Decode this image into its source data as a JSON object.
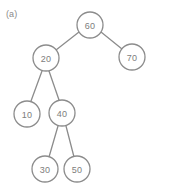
{
  "figure": {
    "label": "(a)",
    "caption_color": "#8a8a8a",
    "background_color": "#ffffff",
    "width": 171,
    "height": 189
  },
  "diagram": {
    "type": "binary-search-tree",
    "node_stroke_color": "#8c8c8c",
    "node_fill_color": "#ffffff",
    "node_text_color": "#7d7d7d",
    "edge_color": "#8c8c8c",
    "node_radius": 13,
    "nodes": [
      {
        "id": "n60",
        "value": "60",
        "cx": 90,
        "cy": 25,
        "r": 13
      },
      {
        "id": "n20",
        "value": "20",
        "cx": 46,
        "cy": 58,
        "r": 13
      },
      {
        "id": "n70",
        "value": "70",
        "cx": 132,
        "cy": 57,
        "r": 13
      },
      {
        "id": "n10",
        "value": "10",
        "cx": 27,
        "cy": 114,
        "r": 13
      },
      {
        "id": "n40",
        "value": "40",
        "cx": 62,
        "cy": 113,
        "r": 13
      },
      {
        "id": "n30",
        "value": "30",
        "cx": 45,
        "cy": 169,
        "r": 13
      },
      {
        "id": "n50",
        "value": "50",
        "cx": 77,
        "cy": 169,
        "r": 13
      }
    ],
    "edges": [
      {
        "id": "e60-20",
        "from": "n60",
        "to": "n20",
        "x1": 79,
        "y1": 32,
        "x2": 56,
        "y2": 50
      },
      {
        "id": "e60-70",
        "from": "n60",
        "to": "n70",
        "x1": 101,
        "y1": 32,
        "x2": 122,
        "y2": 49
      },
      {
        "id": "e20-10",
        "from": "n20",
        "to": "n10",
        "x1": 42,
        "y1": 71,
        "x2": 31,
        "y2": 101
      },
      {
        "id": "e20-40",
        "from": "n20",
        "to": "n40",
        "x1": 49,
        "y1": 71,
        "x2": 59,
        "y2": 100
      },
      {
        "id": "e40-30",
        "from": "n40",
        "to": "n30",
        "x1": 58,
        "y1": 126,
        "x2": 49,
        "y2": 157
      },
      {
        "id": "e40-50",
        "from": "n40",
        "to": "n50",
        "x1": 66,
        "y1": 126,
        "x2": 74,
        "y2": 157
      }
    ]
  }
}
